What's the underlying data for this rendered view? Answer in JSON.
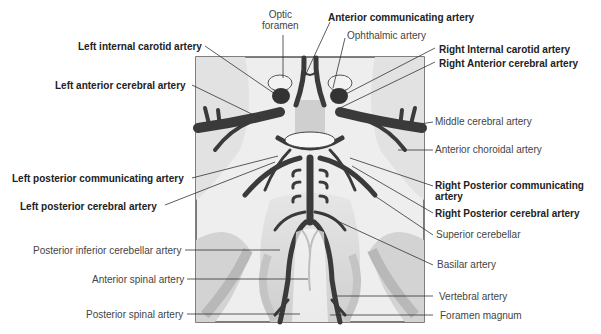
{
  "diagram": {
    "type": "anatomical illustration",
    "labels_top": {
      "optic_foramen": "Optic\nforamen",
      "optic_foramen_l1": "Optic",
      "optic_foramen_l2": "foramen",
      "anterior_communicating": "Anterior communicating artery",
      "ophthalmic": "Ophthalmic artery"
    },
    "labels_left": {
      "left_internal_carotid": "Left internal carotid artery",
      "left_anterior_cerebral": "Left anterior cerebral artery",
      "left_posterior_communicating": "Left posterior communicating artery",
      "left_posterior_cerebral": "Left posterior cerebral artery",
      "posterior_inferior_cerebellar": "Posterior inferior cerebellar artery",
      "anterior_spinal": "Anterior spinal artery",
      "posterior_spinal": "Posterior spinal artery"
    },
    "labels_right": {
      "right_internal_carotid": "Right Internal carotid artery",
      "right_anterior_cerebral": "Right Anterior cerebral artery",
      "middle_cerebral": "Middle cerebral artery",
      "anterior_choroidal": "Anterior choroidal artery",
      "right_posterior_communicating_l1": "Right Posterior communicating",
      "right_posterior_communicating_l2": "artery",
      "right_posterior_cerebral": "Right Posterior cerebral artery",
      "superior_cerebellar": "Superior cerebellar",
      "basilar": "Basilar artery",
      "vertebral": "Vertebral artery",
      "foramen_magnum": "Foramen magnum"
    },
    "colors": {
      "artery": "#3a3a3a",
      "tissue": "#d8d8d8",
      "frame": "#555555",
      "leader": "#333333"
    }
  }
}
